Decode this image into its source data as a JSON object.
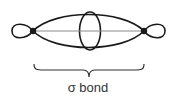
{
  "diagram": {
    "label": "σ bond",
    "colors": {
      "stroke": "#1a1a1a",
      "axis": "#8a8a8a",
      "text": "#333333"
    }
  }
}
